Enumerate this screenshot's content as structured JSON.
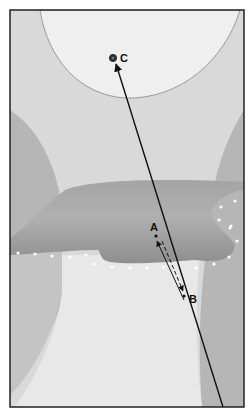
{
  "diagram": {
    "type": "cross-section illustration",
    "labels": {
      "point_a": "A",
      "point_b": "B",
      "point_c": "C"
    },
    "arrows": [
      {
        "name": "long-ray",
        "from": "bottom",
        "to": "C",
        "style": "solid"
      },
      {
        "name": "a-to-b",
        "from": "A",
        "to": "B",
        "style": "dashed"
      },
      {
        "name": "b-to-a",
        "from": "B",
        "to": "A",
        "style": "solid"
      }
    ],
    "colors": {
      "background_light": "#e6e6e6",
      "top_region": "#efefef",
      "side_regions": "#b4b4b4",
      "mid_band": "#9a9a9a",
      "lower_region": "#e2e2e2",
      "dots": "#ffffff",
      "frame": "#222222"
    }
  }
}
